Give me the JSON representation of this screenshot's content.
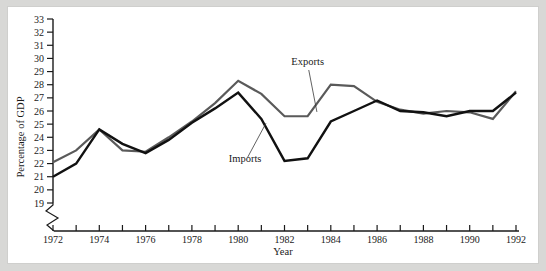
{
  "figure": {
    "background_color": "#d8d8d6",
    "plate_color": "#ffffff"
  },
  "chart_data": {
    "type": "line",
    "title": "",
    "xlabel": "Year",
    "ylabel": "Percentage of GDP",
    "xlim": [
      1972,
      1992
    ],
    "ylim": [
      19,
      33
    ],
    "xticks": [
      1972,
      1973,
      1974,
      1975,
      1976,
      1977,
      1978,
      1979,
      1980,
      1981,
      1982,
      1983,
      1984,
      1985,
      1986,
      1987,
      1988,
      1989,
      1990,
      1991,
      1992
    ],
    "xtick_labels": [
      "1972",
      "",
      "1974",
      "",
      "1976",
      "",
      "1978",
      "",
      "1980",
      "",
      "1982",
      "",
      "1984",
      "",
      "1986",
      "",
      "1988",
      "",
      "1990",
      "",
      "1992"
    ],
    "yticks": [
      19,
      20,
      21,
      22,
      23,
      24,
      25,
      26,
      27,
      28,
      29,
      30,
      31,
      32,
      33
    ],
    "ytick_labels": [
      "19",
      "20",
      "21",
      "22",
      "23",
      "24",
      "25",
      "26",
      "27",
      "28",
      "29",
      "30",
      "31",
      "32",
      "33"
    ],
    "y_axis_broken": true,
    "grid": false,
    "legend_position": "inline-annotation",
    "x": [
      1972,
      1973,
      1974,
      1975,
      1976,
      1977,
      1978,
      1979,
      1980,
      1981,
      1982,
      1983,
      1984,
      1985,
      1986,
      1987,
      1988,
      1989,
      1990,
      1991,
      1992
    ],
    "series": [
      {
        "name": "Exports",
        "color": "#5a5a5a",
        "line_width": 2.2,
        "values": [
          22.1,
          23.0,
          24.6,
          23.0,
          22.9,
          24.0,
          25.2,
          26.6,
          28.3,
          27.3,
          25.6,
          25.6,
          28.0,
          27.9,
          26.7,
          26.1,
          25.8,
          26.0,
          25.9,
          25.4,
          27.5
        ]
      },
      {
        "name": "Imports",
        "color": "#111111",
        "line_width": 2.4,
        "values": [
          21.0,
          22.0,
          24.6,
          23.5,
          22.8,
          23.8,
          25.1,
          26.2,
          27.4,
          25.4,
          22.2,
          22.4,
          25.2,
          26.0,
          26.8,
          26.0,
          25.9,
          25.6,
          26.0,
          26.0,
          27.4
        ]
      }
    ],
    "annotations": [
      {
        "text": "Exports",
        "label_x": 1983.0,
        "label_y": 29.5,
        "target_x": 1983.4,
        "target_y": 25.7
      },
      {
        "text": "Imports",
        "label_x": 1980.3,
        "label_y": 22.1,
        "target_x": 1981.2,
        "target_y": 25.3
      }
    ]
  }
}
